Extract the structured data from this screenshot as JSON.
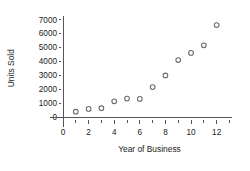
{
  "chart_data": {
    "type": "scatter",
    "title": "",
    "xlabel": "Year of Business",
    "ylabel": "Units Sold",
    "xlim": [
      -1.05,
      13.2
    ],
    "ylim": [
      -700,
      7450
    ],
    "grid": false,
    "legend": null,
    "marker": "open-circle",
    "marker_color": "#6b6b6b",
    "x_ticks": [
      0,
      2,
      4,
      6,
      8,
      10,
      12
    ],
    "x_tick_labels": [
      "0",
      "2",
      "4",
      "6",
      "8",
      "10",
      "12"
    ],
    "x_minor_ticks": [
      1,
      3,
      5,
      7,
      9,
      11,
      13
    ],
    "y_ticks": [
      0,
      1000,
      2000,
      3000,
      4000,
      5000,
      6000,
      7000
    ],
    "y_tick_labels": [
      "0",
      "1000",
      "2000",
      "3000",
      "4000",
      "5000",
      "6000",
      "7000"
    ],
    "x": [
      1,
      2,
      3,
      4,
      5,
      6,
      7,
      8,
      9,
      10,
      11,
      12
    ],
    "values": [
      380,
      580,
      630,
      1130,
      1320,
      1300,
      2150,
      2980,
      4090,
      4600,
      5150,
      6600
    ],
    "points": [
      {
        "x": 1,
        "y": 380
      },
      {
        "x": 2,
        "y": 580
      },
      {
        "x": 3,
        "y": 630
      },
      {
        "x": 4,
        "y": 1130
      },
      {
        "x": 5,
        "y": 1320
      },
      {
        "x": 6,
        "y": 1300
      },
      {
        "x": 7,
        "y": 2150
      },
      {
        "x": 8,
        "y": 2980
      },
      {
        "x": 9,
        "y": 4090
      },
      {
        "x": 10,
        "y": 4600
      },
      {
        "x": 11,
        "y": 5150
      },
      {
        "x": 12,
        "y": 6600
      }
    ]
  }
}
